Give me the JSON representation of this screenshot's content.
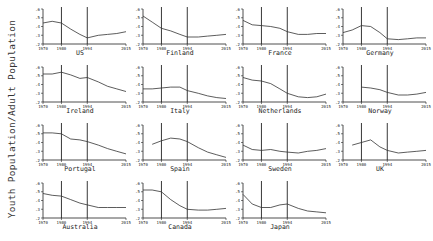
{
  "ylabel": "Youth Population/Adult Population",
  "chart_data": {
    "type": "line",
    "title": "",
    "ylabel": "Youth Population/Adult Population",
    "xlabel": "",
    "xlim": [
      1970,
      2015
    ],
    "ylim": [
      0.2,
      0.6
    ],
    "xticks": [
      "1970",
      "1980",
      "1994",
      "2015"
    ],
    "yticks": [
      ".2",
      ".3",
      ".4",
      ".5",
      ".6"
    ],
    "vlines": [
      1980,
      1994
    ],
    "grid": false,
    "layout": "4x4 small multiples (15 panels)",
    "x": [
      1970,
      1975,
      1980,
      1985,
      1990,
      1994,
      2000,
      2005,
      2010,
      2015
    ],
    "panels": [
      {
        "name": "US",
        "values": [
          0.44,
          0.46,
          0.44,
          0.37,
          0.31,
          0.27,
          0.3,
          0.31,
          0.32,
          0.34
        ],
        "note": "break at 1994"
      },
      {
        "name": "Finland",
        "values": [
          0.52,
          0.45,
          0.38,
          0.35,
          0.31,
          0.28,
          0.28,
          0.29,
          0.3,
          0.31
        ]
      },
      {
        "name": "France",
        "values": [
          0.47,
          0.42,
          0.41,
          0.4,
          0.38,
          0.34,
          0.31,
          0.31,
          0.32,
          0.32
        ]
      },
      {
        "name": "Germany",
        "values": [
          0.33,
          0.36,
          0.41,
          0.4,
          0.33,
          0.26,
          0.25,
          0.26,
          0.27,
          0.27
        ]
      },
      {
        "name": "Ireland",
        "values": [
          0.52,
          0.52,
          0.54,
          0.51,
          0.47,
          0.48,
          0.43,
          0.38,
          0.35,
          0.32
        ]
      },
      {
        "name": "Italy",
        "values": [
          0.35,
          0.35,
          0.36,
          0.37,
          0.37,
          0.33,
          0.3,
          0.27,
          0.25,
          0.24
        ]
      },
      {
        "name": "Netherlands",
        "values": [
          0.48,
          0.45,
          0.44,
          0.41,
          0.35,
          0.3,
          0.26,
          0.25,
          0.26,
          0.29
        ]
      },
      {
        "name": "Norway",
        "values": [
          null,
          null,
          0.37,
          0.36,
          0.34,
          0.31,
          0.28,
          0.28,
          0.29,
          0.31
        ]
      },
      {
        "name": "Portugal",
        "values": [
          0.51,
          0.51,
          0.5,
          0.44,
          0.43,
          0.41,
          0.37,
          0.33,
          0.3,
          0.27
        ],
        "note": "spike ~0.58 near 1981"
      },
      {
        "name": "Spain",
        "values": [
          null,
          0.38,
          0.42,
          0.45,
          0.44,
          0.41,
          0.34,
          0.29,
          0.26,
          0.23
        ]
      },
      {
        "name": "Sweden",
        "values": [
          0.37,
          0.32,
          0.31,
          0.32,
          0.3,
          0.29,
          0.28,
          0.3,
          0.31,
          0.33
        ]
      },
      {
        "name": "UK",
        "values": [
          null,
          0.37,
          0.4,
          0.43,
          0.35,
          0.31,
          0.28,
          0.29,
          0.3,
          0.31
        ]
      },
      {
        "name": "Australia",
        "values": [
          0.48,
          0.46,
          0.45,
          0.41,
          0.37,
          0.35,
          0.32,
          0.32,
          0.32,
          0.32
        ]
      },
      {
        "name": "Canada",
        "values": [
          0.52,
          0.52,
          0.5,
          0.41,
          0.34,
          0.3,
          0.29,
          0.29,
          0.3,
          0.31
        ]
      },
      {
        "name": "Japan",
        "values": [
          0.47,
          0.36,
          0.32,
          0.32,
          0.35,
          0.36,
          0.31,
          0.28,
          0.27,
          0.26
        ]
      }
    ]
  }
}
